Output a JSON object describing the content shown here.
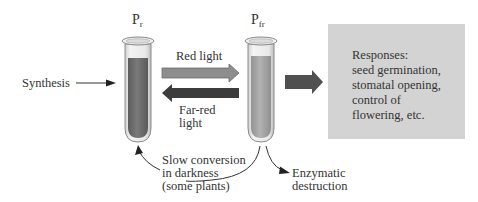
{
  "diagram": {
    "forms": {
      "pr": {
        "label_main": "P",
        "label_sub": "r"
      },
      "pfr": {
        "label_main": "P",
        "label_sub": "fr"
      }
    },
    "arrows": {
      "synthesis": "Synthesis",
      "red_light": "Red light",
      "far_red_light_line1": "Far-red",
      "far_red_light_line2": "light",
      "slow_conversion_line1": "Slow conversion",
      "slow_conversion_line2": "in darkness",
      "slow_conversion_line3": "(some plants)",
      "enzymatic_line1": "Enzymatic",
      "enzymatic_line2": "destruction"
    },
    "responses": {
      "text": "Responses:\nseed germination,\nstomatal opening,\ncontrol of\nflowering, etc."
    },
    "colors": {
      "red_light_arrow": "#8d8d8d",
      "far_red_arrow": "#3c3c3c",
      "pr_liquid": "#6f6f6f",
      "pfr_liquid": "#a5a5a5",
      "response_box": "#d3d3d3",
      "output_arrow": "#505050"
    }
  }
}
